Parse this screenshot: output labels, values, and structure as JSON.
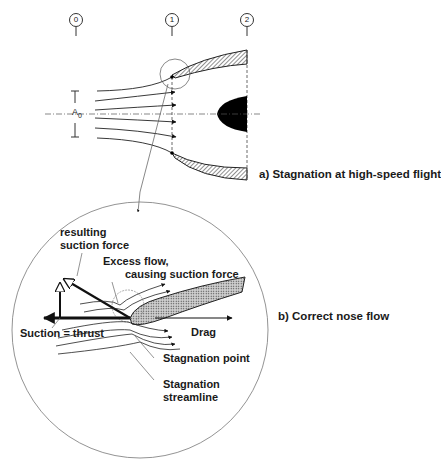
{
  "figure": {
    "stations": [
      {
        "label": "0"
      },
      {
        "label": "1"
      },
      {
        "label": "2"
      }
    ],
    "area_label": "A",
    "area_subscript": "0",
    "part_a_caption": "a) Stagnation at high-speed flight",
    "part_b_caption": "b) Correct nose flow",
    "labels": {
      "resulting_suction_force": [
        "resulting",
        "suction force"
      ],
      "excess_flow": [
        "Excess flow,",
        "causing suction force"
      ],
      "suction_thrust": "Suction = thrust",
      "drag": "Drag",
      "stagnation_point": "Stagnation point",
      "stagnation_streamline": [
        "Stagnation",
        "streamline"
      ]
    }
  }
}
